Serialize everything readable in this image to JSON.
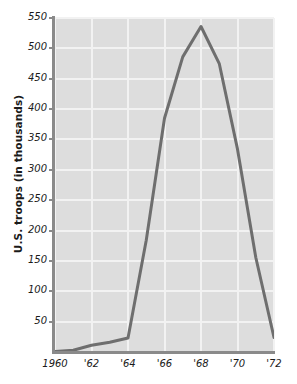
{
  "chart_data": {
    "type": "line",
    "title": "",
    "xlabel": "",
    "ylabel": "U.S. troops (in thousands)",
    "x": [
      1960,
      1961,
      1962,
      1963,
      1964,
      1965,
      1966,
      1967,
      1968,
      1969,
      1970,
      1971,
      1972
    ],
    "x_tick_values": [
      1960,
      1962,
      1964,
      1966,
      1968,
      1970,
      1972
    ],
    "x_tick_labels": [
      "1960",
      "'62",
      "'64",
      "'66",
      "'68",
      "'70",
      "'72"
    ],
    "xlim": [
      1960,
      1972
    ],
    "y_tick_values": [
      50,
      100,
      150,
      200,
      250,
      300,
      350,
      400,
      450,
      500,
      550
    ],
    "y_tick_labels": [
      "50",
      "100",
      "150",
      "200",
      "250",
      "300",
      "350",
      "400",
      "450",
      "500",
      "550"
    ],
    "ylim": [
      0,
      550
    ],
    "grid": true,
    "legend": "none",
    "series": [
      {
        "name": "U.S. troops in Vietnam",
        "color": "#6e6e6e",
        "values": [
          1,
          3,
          11,
          16,
          23,
          184,
          385,
          486,
          536,
          475,
          334,
          156,
          24
        ]
      }
    ],
    "plot_background": "#dddddd",
    "gridline_color": "#f2f2f2",
    "axis_color": "#8a8a8a",
    "text_color": "#1a1a1a"
  }
}
